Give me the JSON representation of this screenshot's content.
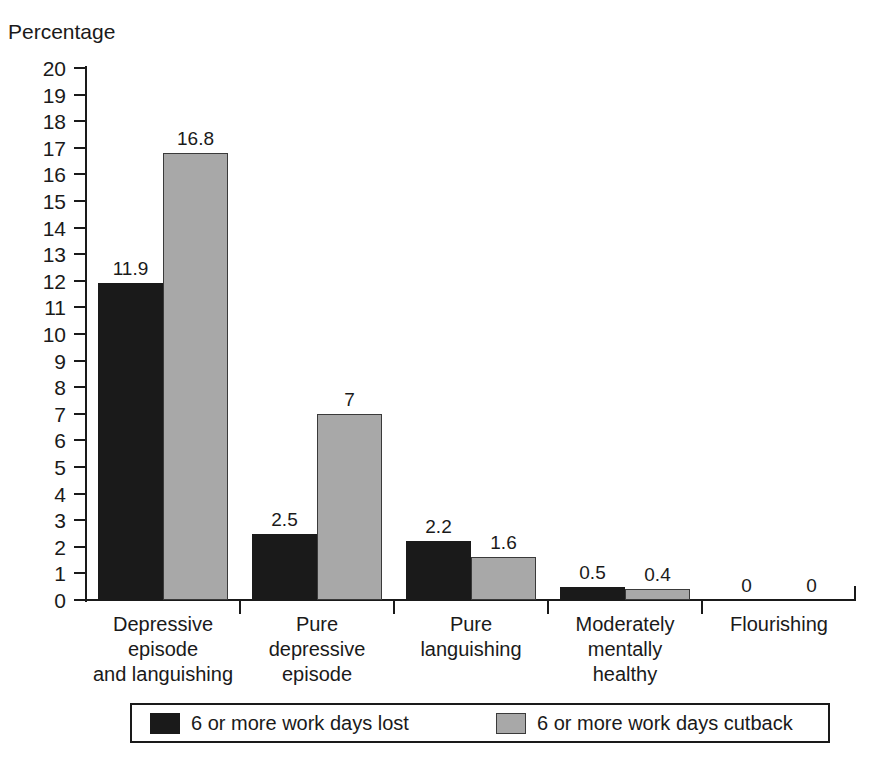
{
  "chart_data": {
    "type": "bar",
    "title": "",
    "ylabel": "Percentage",
    "xlabel": "",
    "ylim": [
      0,
      20
    ],
    "ytick_step": 1,
    "grid": false,
    "legend_position": "bottom",
    "categories": [
      "Depressive episode and languishing",
      "Pure depressive episode",
      "Pure languishing",
      "Moderately mentally healthy",
      "Flourishing"
    ],
    "category_lines": [
      [
        "Depressive",
        "episode",
        "and languishing"
      ],
      [
        "Pure",
        "depressive",
        "episode"
      ],
      [
        "Pure",
        "languishing"
      ],
      [
        "Moderately",
        "mentally",
        "healthy"
      ],
      [
        "Flourishing"
      ]
    ],
    "series": [
      {
        "name": "6 or more work days lost",
        "color": "#1a1a1a",
        "values": [
          11.9,
          2.5,
          2.2,
          0.5,
          0
        ],
        "labels": [
          "11.9",
          "2.5",
          "2.2",
          "0.5",
          "0"
        ]
      },
      {
        "name": "6 or more work days cutback",
        "color": "#a8a8a8",
        "values": [
          16.8,
          7,
          1.6,
          0.4,
          0
        ],
        "labels": [
          "16.8",
          "7",
          "1.6",
          "0.4",
          "0"
        ]
      }
    ],
    "ytick_labels": [
      "20",
      "19",
      "18",
      "17",
      "16",
      "15",
      "14",
      "13",
      "12",
      "11",
      "10",
      "9",
      "8",
      "7",
      "6",
      "5",
      "4",
      "3",
      "2",
      "1",
      "0"
    ]
  },
  "axis": {
    "y_title": "Percentage"
  },
  "legend": {
    "entries": [
      {
        "label": "6 or more work days lost",
        "swatch": "dark"
      },
      {
        "label": "6 or more work days cutback",
        "swatch": "light"
      }
    ]
  }
}
